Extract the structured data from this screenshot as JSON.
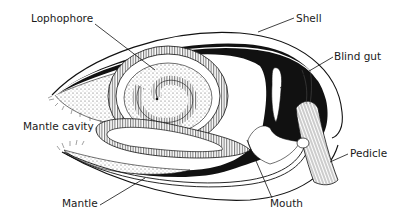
{
  "diagram": {
    "colors": {
      "ink": "#111111",
      "background": "#ffffff",
      "stipple": "#cfcfcf"
    },
    "labels": {
      "lophophore": "Lophophore",
      "shell": "Shell",
      "blind_gut": "Blind gut",
      "mantle_cavity": "Mantle cavity",
      "pedicle": "Pedicle",
      "mantle": "Mantle",
      "mouth": "Mouth"
    }
  }
}
